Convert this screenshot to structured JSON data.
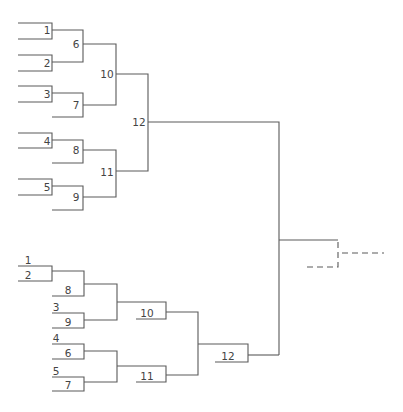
{
  "upper_bracket": {
    "seeds": [
      {
        "label": "1",
        "x": 47,
        "y": 34
      },
      {
        "label": "2",
        "x": 47,
        "y": 67
      },
      {
        "label": "3",
        "x": 47,
        "y": 98
      },
      {
        "label": "4",
        "x": 47,
        "y": 145
      },
      {
        "label": "5",
        "x": 47,
        "y": 191
      }
    ],
    "round1": [
      {
        "label": "6",
        "x": 76,
        "y": 48
      },
      {
        "label": "7",
        "x": 76,
        "y": 109
      },
      {
        "label": "8",
        "x": 76,
        "y": 154
      },
      {
        "label": "9",
        "x": 76,
        "y": 201
      }
    ],
    "round2": [
      {
        "label": "10",
        "x": 102,
        "y": 78
      },
      {
        "label": "11",
        "x": 102,
        "y": 176
      }
    ],
    "final": {
      "label": "12",
      "x": 133,
      "y": 126
    }
  },
  "lower_bracket": {
    "seeds": [
      {
        "label": "1",
        "x": 24,
        "y": 264
      },
      {
        "label": "2",
        "x": 24,
        "y": 279
      },
      {
        "label": "8",
        "x": 64,
        "y": 294
      },
      {
        "label": "3",
        "x": 52,
        "y": 311
      },
      {
        "label": "9",
        "x": 64,
        "y": 326
      },
      {
        "label": "4",
        "x": 52,
        "y": 342
      },
      {
        "label": "6",
        "x": 64,
        "y": 357
      },
      {
        "label": "5",
        "x": 52,
        "y": 375
      },
      {
        "label": "7",
        "x": 64,
        "y": 389
      }
    ],
    "round2": [
      {
        "label": "10",
        "x": 140,
        "y": 317
      },
      {
        "label": "11",
        "x": 140,
        "y": 380
      }
    ],
    "final": {
      "label": "12",
      "x": 221,
      "y": 360
    }
  },
  "colors": {
    "line": "#5a5a5a",
    "text": "#444444",
    "background": "#ffffff"
  }
}
